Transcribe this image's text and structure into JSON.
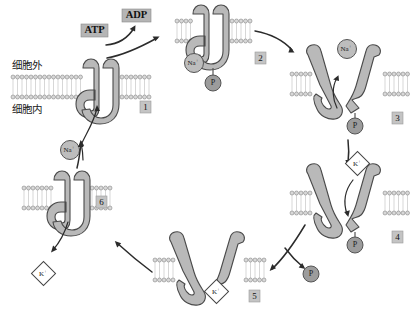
{
  "figure": {
    "background_color": "#ffffff",
    "protein_color": "#b9b9b9",
    "membrane_head_color": "#d8d8d8",
    "label_box_color": "#b5b5b5",
    "step_box_color": "#c4c4c4"
  },
  "region_labels": [
    {
      "id": "extracellular",
      "text": "细胞外"
    },
    {
      "id": "intracellular",
      "text": "细胞内"
    }
  ],
  "nucleotides": [
    {
      "id": "atp",
      "text": "ATP"
    },
    {
      "id": "adp",
      "text": "ADP"
    }
  ],
  "steps": [
    {
      "id": "step-1",
      "number": "1"
    },
    {
      "id": "step-2",
      "number": "2"
    },
    {
      "id": "step-3",
      "number": "3"
    },
    {
      "id": "step-4",
      "number": "4"
    },
    {
      "id": "step-5",
      "number": "5"
    },
    {
      "id": "step-6",
      "number": "6"
    }
  ],
  "ions": [
    {
      "id": "na-1",
      "text": "Na",
      "sup": "+",
      "shape": "circle"
    },
    {
      "id": "na-2",
      "text": "Na",
      "sup": "+",
      "shape": "circle"
    },
    {
      "id": "na-3",
      "text": "Na",
      "sup": "+",
      "shape": "circle"
    },
    {
      "id": "k-4",
      "text": "K",
      "sup": "+",
      "shape": "diamond"
    },
    {
      "id": "k-5",
      "text": "K",
      "sup": "+",
      "shape": "diamond"
    },
    {
      "id": "k-6",
      "text": "K",
      "sup": "+",
      "shape": "diamond"
    }
  ],
  "phosphates": [
    {
      "id": "p-step2",
      "text": "P"
    },
    {
      "id": "p-step3",
      "text": "P"
    },
    {
      "id": "p-step4",
      "text": "P"
    },
    {
      "id": "p-released",
      "text": "P"
    }
  ]
}
